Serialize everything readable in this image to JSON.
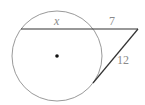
{
  "diagram": {
    "type": "circle-secant-tangent",
    "circle": {
      "cx": 57,
      "cy": 56,
      "r": 45,
      "stroke": "#9a9a9a",
      "center_dot": true
    },
    "secant": {
      "x1": 21,
      "y1": 29,
      "x2": 138,
      "y2": 29,
      "stroke": "#333333"
    },
    "tangent": {
      "x1": 138,
      "y1": 29,
      "x2": 93,
      "y2": 83,
      "stroke": "#333333"
    },
    "labels": {
      "internal_segment": "x",
      "external_segment": "7",
      "tangent_segment": "12"
    }
  }
}
